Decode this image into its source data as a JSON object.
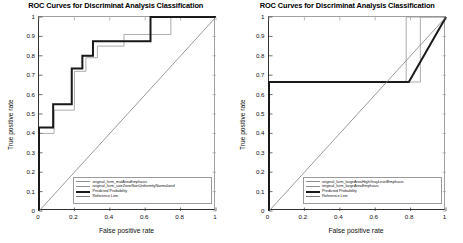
{
  "figure": {
    "panels": [
      {
        "title": "ROC Curves for Discriminat Analysis Classification",
        "xlabel": "False positive rate",
        "ylabel": "True positive rate",
        "xticks": [
          "0",
          "0.2",
          "0.4",
          "0.6",
          "0.8",
          "1"
        ],
        "yticks": [
          "0",
          "0.1",
          "0.2",
          "0.3",
          "0.4",
          "0.5",
          "0.6",
          "0.7",
          "0.8",
          "0.9",
          "1"
        ],
        "legend": [
          {
            "label": "original_lsrm_matAreaEmphasis",
            "style": "thin"
          },
          {
            "label": "original_lsrm_sizeZoneNonUniformityNormalized",
            "style": "thin"
          },
          {
            "label": "Predicted Probability",
            "style": "thick"
          },
          {
            "label": "Reference Line",
            "style": "ref"
          }
        ]
      },
      {
        "title": "ROC Curves for Discriminat Analysis Classification",
        "xlabel": "False positive rate",
        "ylabel": "True positive rate",
        "xticks": [
          "0",
          "0.2",
          "0.4",
          "0.6",
          "0.8",
          "1"
        ],
        "yticks": [
          "0",
          "0.1",
          "0.2",
          "0.3",
          "0.4",
          "0.5",
          "0.6",
          "0.7",
          "0.8",
          "0.9",
          "1"
        ],
        "legend": [
          {
            "label": "original_lsrm_largeAreaHighGrayLevelEmphasis",
            "style": "thin"
          },
          {
            "label": "original_lsrm_largeAreaEmphasis",
            "style": "thin"
          },
          {
            "label": "Predicted Probability",
            "style": "thick"
          },
          {
            "label": "Reference Line",
            "style": "ref"
          }
        ]
      }
    ]
  },
  "chart_data": [
    {
      "type": "line",
      "title": "ROC Curves for Discriminat Analysis Classification",
      "xlabel": "False positive rate",
      "ylabel": "True positive rate",
      "xlim": [
        0,
        1
      ],
      "ylim": [
        0,
        1
      ],
      "xticks": [
        0,
        0.2,
        0.4,
        0.6,
        0.8,
        1
      ],
      "yticks": [
        0,
        0.1,
        0.2,
        0.3,
        0.4,
        0.5,
        0.6,
        0.7,
        0.8,
        0.9,
        1
      ],
      "grid": false,
      "legend_position": "lower-right",
      "series": [
        {
          "name": "original_lsrm_matAreaEmphasis",
          "color": "#909090",
          "width": "thin",
          "points": [
            [
              0,
              0
            ],
            [
              0,
              0.4
            ],
            [
              0.085,
              0.4
            ],
            [
              0.085,
              0.52
            ],
            [
              0.085,
              0.52
            ],
            [
              0.2,
              0.52
            ],
            [
              0.2,
              0.72
            ],
            [
              0.265,
              0.72
            ],
            [
              0.265,
              0.79
            ],
            [
              0.33,
              0.79
            ],
            [
              0.33,
              0.85
            ],
            [
              0.48,
              0.85
            ],
            [
              0.48,
              0.91
            ],
            [
              0.745,
              0.91
            ],
            [
              0.745,
              1.0
            ],
            [
              1.0,
              1.0
            ]
          ]
        },
        {
          "name": "original_lsrm_sizeZoneNonUniformityNormalized",
          "color": "#909090",
          "width": "thin",
          "points": [
            [
              0,
              0
            ],
            [
              0,
              0.43
            ],
            [
              0.08,
              0.43
            ],
            [
              0.08,
              0.55
            ],
            [
              0.185,
              0.55
            ],
            [
              0.185,
              0.735
            ],
            [
              0.245,
              0.735
            ],
            [
              0.245,
              0.8
            ],
            [
              0.305,
              0.8
            ],
            [
              0.305,
              0.875
            ],
            [
              0.63,
              0.875
            ],
            [
              0.63,
              1.0
            ],
            [
              1.0,
              1.0
            ]
          ]
        },
        {
          "name": "Predicted Probability",
          "color": "#1a1a1a",
          "width": "thick",
          "points": [
            [
              0,
              0
            ],
            [
              0,
              0.43
            ],
            [
              0.08,
              0.43
            ],
            [
              0.08,
              0.55
            ],
            [
              0.185,
              0.55
            ],
            [
              0.185,
              0.735
            ],
            [
              0.245,
              0.735
            ],
            [
              0.245,
              0.8
            ],
            [
              0.305,
              0.8
            ],
            [
              0.305,
              0.875
            ],
            [
              0.63,
              0.875
            ],
            [
              0.63,
              1.0
            ],
            [
              1.0,
              1.0
            ]
          ]
        },
        {
          "name": "Reference Line",
          "color": "#7a7a7a",
          "width": "thin",
          "points": [
            [
              0,
              0
            ],
            [
              1,
              1
            ]
          ]
        }
      ]
    },
    {
      "type": "line",
      "title": "ROC Curves for Discriminat Analysis Classification",
      "xlabel": "False positive rate",
      "ylabel": "True positive rate",
      "xlim": [
        0,
        1
      ],
      "ylim": [
        0,
        1
      ],
      "xticks": [
        0,
        0.2,
        0.4,
        0.6,
        0.8,
        1
      ],
      "yticks": [
        0,
        0.1,
        0.2,
        0.3,
        0.4,
        0.5,
        0.6,
        0.7,
        0.8,
        0.9,
        1
      ],
      "grid": false,
      "legend_position": "lower-right",
      "series": [
        {
          "name": "original_lsrm_largeAreaHighGrayLevelEmphasis",
          "color": "#909090",
          "width": "thin",
          "points": [
            [
              0,
              0
            ],
            [
              0,
              0.665
            ],
            [
              0.775,
              0.665
            ],
            [
              0.775,
              1.0
            ],
            [
              1.0,
              1.0
            ]
          ]
        },
        {
          "name": "original_lsrm_largeAreaEmphasis",
          "color": "#909090",
          "width": "thin",
          "points": [
            [
              0,
              0
            ],
            [
              0,
              0.665
            ],
            [
              0.855,
              0.665
            ],
            [
              0.855,
              1.0
            ],
            [
              1.0,
              1.0
            ]
          ]
        },
        {
          "name": "Predicted Probability",
          "color": "#1a1a1a",
          "width": "thick",
          "points": [
            [
              0,
              0
            ],
            [
              0,
              0.665
            ],
            [
              0.79,
              0.665
            ],
            [
              1.0,
              1.0
            ]
          ]
        },
        {
          "name": "Reference Line",
          "color": "#7a7a7a",
          "width": "thin",
          "points": [
            [
              0,
              0
            ],
            [
              1,
              1
            ]
          ]
        }
      ]
    }
  ]
}
